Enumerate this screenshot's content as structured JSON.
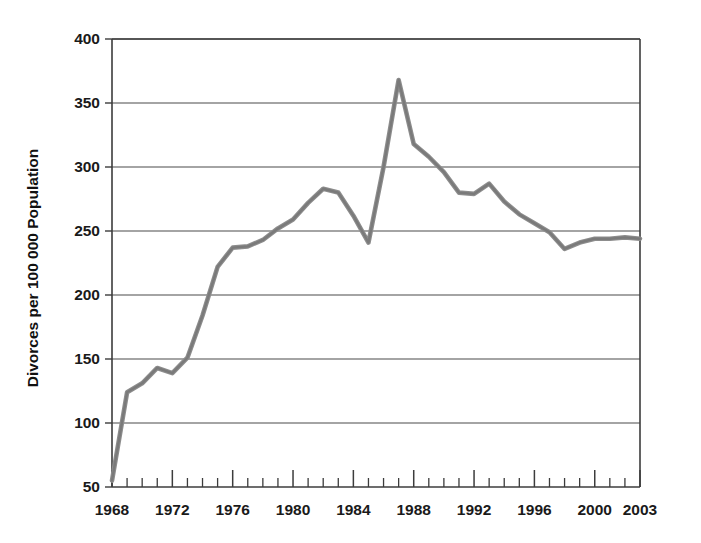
{
  "chart_data": {
    "type": "line",
    "title": "",
    "xlabel": "",
    "ylabel": "Divorces per 100 000 Population",
    "xlim": [
      1968,
      2003
    ],
    "ylim": [
      50,
      400
    ],
    "grid": "horizontal",
    "legend": "none",
    "line_color": "#8d8d8d",
    "ytick_labels": [
      "400",
      "350",
      "300",
      "250",
      "200",
      "150",
      "100",
      "50"
    ],
    "ytick_values": [
      400,
      350,
      300,
      250,
      200,
      150,
      100,
      50
    ],
    "xtick_labels": [
      "1968",
      "1972",
      "1976",
      "1980",
      "1984",
      "1988",
      "1992",
      "1996",
      "2000",
      "2003"
    ],
    "xtick_values": [
      1968,
      1972,
      1976,
      1980,
      1984,
      1988,
      1992,
      1996,
      2000,
      2003
    ],
    "x": [
      1968,
      1969,
      1970,
      1971,
      1972,
      1973,
      1974,
      1975,
      1976,
      1977,
      1978,
      1979,
      1980,
      1981,
      1982,
      1983,
      1984,
      1985,
      1986,
      1987,
      1988,
      1989,
      1990,
      1991,
      1992,
      1993,
      1994,
      1995,
      1996,
      1997,
      1998,
      1999,
      2000,
      2001,
      2002,
      2003
    ],
    "values": [
      55,
      124,
      131,
      143,
      139,
      151,
      184,
      222,
      237,
      238,
      243,
      252,
      259,
      272,
      283,
      280,
      262,
      241,
      300,
      368,
      318,
      308,
      296,
      280,
      279,
      287,
      273,
      263,
      256,
      249,
      236,
      241,
      244,
      244,
      245,
      244
    ],
    "series": [
      {
        "name": "Divorce rate",
        "values": [
          55,
          124,
          131,
          143,
          139,
          151,
          184,
          222,
          237,
          238,
          243,
          252,
          259,
          272,
          283,
          280,
          262,
          241,
          300,
          368,
          318,
          308,
          296,
          280,
          279,
          287,
          273,
          263,
          256,
          249,
          236,
          241,
          244,
          244,
          245,
          244
        ]
      }
    ],
    "annotations": []
  }
}
